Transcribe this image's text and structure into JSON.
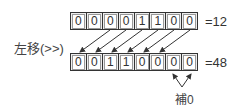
{
  "operation_label": "左移(>>)",
  "top_row": {
    "bits": [
      "0",
      "0",
      "0",
      "0",
      "1",
      "1",
      "0",
      "0"
    ],
    "equals_label": "=12"
  },
  "bottom_row": {
    "bits": [
      "0",
      "0",
      "1",
      "1",
      "0",
      "0",
      "0",
      "0"
    ],
    "equals_label": "=48"
  },
  "padding_label": "補0",
  "colors": {
    "border": "#333333",
    "cell_bg": "#ededed",
    "arrow": "#333333"
  }
}
